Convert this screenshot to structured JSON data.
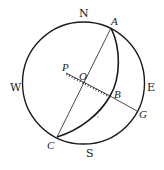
{
  "diagram": {
    "type": "celestial-sphere-construction",
    "colors": {
      "stroke": "#1a1a1a",
      "background": "#ffffff",
      "text": "#222222"
    },
    "circle": {
      "cx": 83.5,
      "cy": 83,
      "r": 61
    },
    "compass_labels": {
      "north": {
        "text": "N",
        "x": 79,
        "y": 17
      },
      "south": {
        "text": "S",
        "x": 86,
        "y": 157
      },
      "west": {
        "text": "W",
        "x": 10,
        "y": 91
      },
      "east": {
        "text": "E",
        "x": 147,
        "y": 91
      }
    },
    "points": {
      "A": {
        "text": "A",
        "x": 111,
        "y": 28,
        "label_x": 111,
        "label_y": 24
      },
      "C": {
        "text": "C",
        "x": 57,
        "y": 137,
        "label_x": 47,
        "label_y": 148
      },
      "O": {
        "text": "O",
        "x": 84,
        "y": 82,
        "label_x": 79,
        "label_y": 80
      },
      "P": {
        "text": "P",
        "x": 66,
        "y": 73,
        "label_x": 62,
        "label_y": 72
      },
      "B": {
        "text": "B",
        "x": 110,
        "y": 96,
        "label_x": 114,
        "label_y": 97
      },
      "G": {
        "text": "G",
        "x": 137,
        "y": 111,
        "label_x": 138,
        "label_y": 118
      }
    },
    "lines": [
      {
        "name": "diameter-AC",
        "from": "A",
        "to": "C",
        "style": "solid"
      },
      {
        "name": "segment-PB",
        "from": "P",
        "to": "B",
        "style": "ticked"
      },
      {
        "name": "segment-BG",
        "from": "B",
        "to": "G",
        "style": "solid"
      }
    ],
    "arcs": [
      {
        "name": "great-circle-arc-ABC",
        "path": "M111,28 Q128,80 57,137",
        "style": "solid-thick"
      }
    ]
  }
}
